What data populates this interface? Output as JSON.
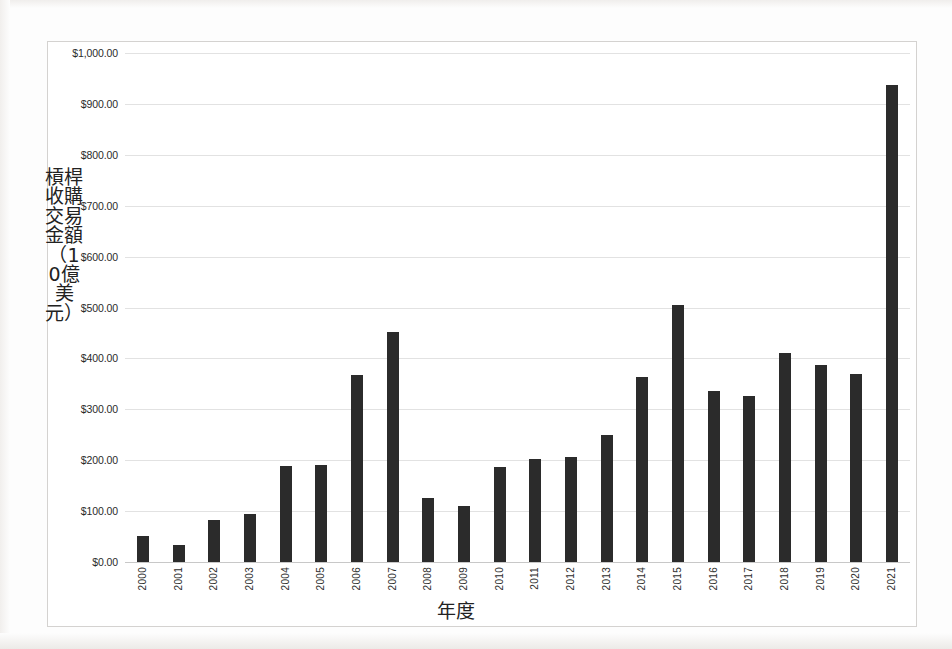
{
  "chart_data": {
    "type": "bar",
    "title": "",
    "xlabel": "年度",
    "ylabel": "槓桿收購交易金額（10億美元）",
    "categories": [
      "2000",
      "2001",
      "2002",
      "2003",
      "2004",
      "2005",
      "2006",
      "2007",
      "2008",
      "2009",
      "2010",
      "2011",
      "2012",
      "2013",
      "2014",
      "2015",
      "2016",
      "2017",
      "2018",
      "2019",
      "2020",
      "2021"
    ],
    "values": [
      52,
      33,
      83,
      94,
      188,
      191,
      367,
      452,
      125,
      110,
      186,
      202,
      207,
      249,
      363,
      504,
      336,
      326,
      410,
      387,
      369,
      938
    ],
    "ylim": [
      0,
      1000
    ],
    "ytick_labels": [
      "$0.00",
      "$100.00",
      "$200.00",
      "$300.00",
      "$400.00",
      "$500.00",
      "$600.00",
      "$700.00",
      "$800.00",
      "$900.00",
      "$1,000.00"
    ],
    "ytick_values": [
      0,
      100,
      200,
      300,
      400,
      500,
      600,
      700,
      800,
      900,
      1000
    ],
    "grid": true,
    "legend": "none",
    "bar_color": "#2b2b2b",
    "grid_color": "#e2e2e2",
    "frame_color": "#d4d2d0",
    "background": "#ffffff"
  }
}
